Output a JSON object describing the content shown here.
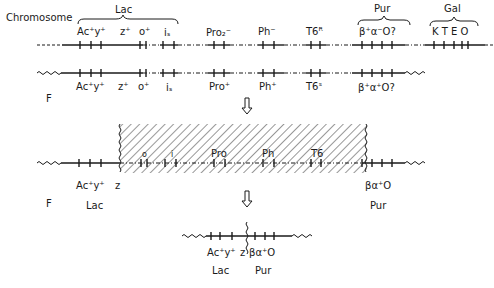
{
  "diagram": {
    "row1": {
      "title": "Chromosome",
      "groups": [
        {
          "name": "Lac",
          "genes": [
            "Ac⁺y⁺",
            "z⁺",
            "o⁺",
            "iₛ"
          ]
        },
        {
          "name": "Pur",
          "genes": [
            "β⁺α⁻O?"
          ]
        },
        {
          "name": "Gal",
          "genes": [
            "K T E O"
          ]
        }
      ],
      "labels": {
        "ac_y": "Ac⁺y⁺",
        "z": "z⁺",
        "o": "o⁺",
        "i": "iₛ",
        "pro": "Pro₂⁻",
        "ph": "Ph⁻",
        "t6": "T6ᴿ",
        "pur_genes": "β⁺α⁻O?",
        "gal_genes": "K T E O",
        "lac": "Lac",
        "pur": "Pur",
        "gal": "Gal"
      }
    },
    "row2": {
      "title": "F",
      "labels": {
        "ac_y": "Ac⁺y⁺",
        "z": "z⁺",
        "o": "o⁺",
        "i": "iₛ",
        "pro": "Pro⁺",
        "ph": "Ph⁺",
        "t6": "T6ˢ",
        "pur_genes": "β⁺α⁺O?"
      }
    },
    "row3": {
      "title": "F",
      "labels": {
        "ac_y": "Ac⁺y⁺",
        "z": "z",
        "o": "o",
        "i": "i",
        "pro": "Pro",
        "ph": "Ph",
        "t6": "T6",
        "pur_genes": "βα⁺O",
        "lac": "Lac",
        "pur": "Pur"
      }
    },
    "row4": {
      "labels": {
        "ac_y": "Ac⁺y⁺",
        "z": "z",
        "pur_genes": "βα⁺O",
        "lac": "Lac",
        "pur": "Pur"
      }
    }
  }
}
